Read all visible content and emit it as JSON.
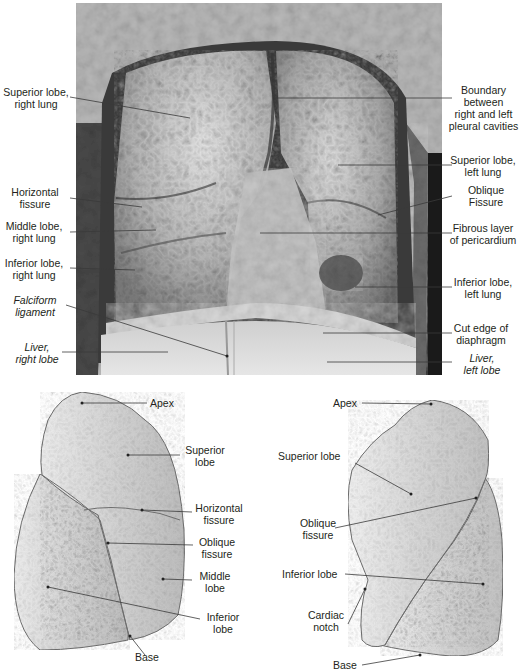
{
  "figure": {
    "photo_panel": {
      "description": "Anterior view of opened thoracic cavity (grayscale cadaver photograph)",
      "labels_left": [
        {
          "id": "superior-lobe-right-lung",
          "lines": [
            "Superior lobe,",
            "right lung"
          ],
          "italic": false
        },
        {
          "id": "horizontal-fissure",
          "lines": [
            "Horizontal",
            "fissure"
          ],
          "italic": false
        },
        {
          "id": "middle-lobe-right-lung",
          "lines": [
            "Middle lobe,",
            "right lung"
          ],
          "italic": false
        },
        {
          "id": "inferior-lobe-right-lung",
          "lines": [
            "Inferior lobe,",
            "right lung"
          ],
          "italic": false
        },
        {
          "id": "falciform-ligament",
          "lines": [
            "Falciform",
            "ligament"
          ],
          "italic": true
        },
        {
          "id": "liver-right-lobe",
          "lines": [
            "Liver,",
            "right lobe"
          ],
          "italic": true
        }
      ],
      "labels_right": [
        {
          "id": "boundary-pleural-cavities",
          "lines": [
            "Boundary",
            "between",
            "right and left",
            "pleural cavities"
          ],
          "italic": false
        },
        {
          "id": "superior-lobe-left-lung",
          "lines": [
            "Superior lobe,",
            "left lung"
          ],
          "italic": false
        },
        {
          "id": "oblique-fissure-photo",
          "lines": [
            "Oblique",
            "Fissure"
          ],
          "italic": false
        },
        {
          "id": "fibrous-pericardium",
          "lines": [
            "Fibrous layer",
            "of pericardium"
          ],
          "italic": false
        },
        {
          "id": "inferior-lobe-left-lung",
          "lines": [
            "Inferior lobe,",
            "left lung"
          ],
          "italic": false
        },
        {
          "id": "cut-edge-diaphragm",
          "lines": [
            "Cut edge of",
            "diaphragm"
          ],
          "italic": false
        },
        {
          "id": "liver-left-lobe",
          "lines": [
            "Liver,",
            "left lobe"
          ],
          "italic": true
        }
      ]
    },
    "right_lung_drawing": {
      "labels": [
        {
          "id": "apex-right",
          "lines": [
            "Apex"
          ]
        },
        {
          "id": "superior-lobe-right",
          "lines": [
            "Superior",
            "lobe"
          ]
        },
        {
          "id": "horizontal-fissure-right",
          "lines": [
            "Horizontal",
            "fissure"
          ]
        },
        {
          "id": "oblique-fissure-right",
          "lines": [
            "Oblique",
            "fissure"
          ]
        },
        {
          "id": "middle-lobe-right",
          "lines": [
            "Middle",
            "lobe"
          ]
        },
        {
          "id": "inferior-lobe-right",
          "lines": [
            "Inferior",
            "lobe"
          ]
        },
        {
          "id": "base-right",
          "lines": [
            "Base"
          ]
        }
      ]
    },
    "left_lung_drawing": {
      "labels": [
        {
          "id": "apex-left",
          "lines": [
            "Apex"
          ]
        },
        {
          "id": "superior-lobe-left",
          "lines": [
            "Superior lobe"
          ]
        },
        {
          "id": "oblique-fissure-left",
          "lines": [
            "Oblique",
            "fissure"
          ]
        },
        {
          "id": "inferior-lobe-left",
          "lines": [
            "Inferior lobe"
          ]
        },
        {
          "id": "cardiac-notch",
          "lines": [
            "Cardiac",
            "notch"
          ]
        },
        {
          "id": "base-left",
          "lines": [
            "Base"
          ]
        }
      ]
    },
    "colors": {
      "leader_line": "#3a3a3a",
      "text": "#231f20",
      "lung_fill": "#d4d4d4",
      "lung_outline": "#6e6e6e",
      "photo_dark": "#2a2a2a",
      "photo_mid": "#8a8a8a",
      "photo_light": "#d8d8d8"
    }
  }
}
